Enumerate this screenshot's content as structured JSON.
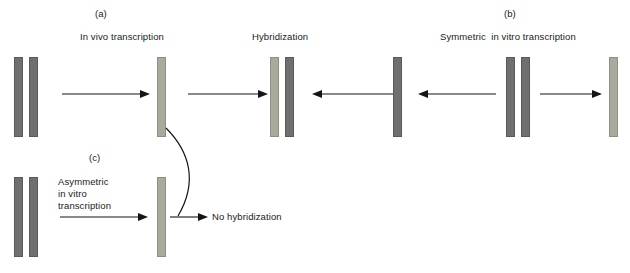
{
  "figure": {
    "colors": {
      "double_strand_dark": "#6f6f6f",
      "single_strand_light": "#a9a99c",
      "stroke": "#151515",
      "background": "#ffffff"
    }
  },
  "panels": {
    "a": {
      "tag": "(a)",
      "process_label": "In vivo transcription",
      "result_label": "Hybridization"
    },
    "b": {
      "tag": "(b)",
      "process_label": "Symmetric  in vitro transcription"
    },
    "c": {
      "tag": "(c)",
      "process_label_line1": "Asymmetric",
      "process_label_line2": "in vitro",
      "process_label_line3": "transcription",
      "result_label": "No hybridization"
    }
  },
  "elements": {
    "a_dsdna_left": "double-stranded-dna",
    "a_ssrna": "single-strand-light",
    "a_hybrid_light": "hybrid-light-strand",
    "a_hybrid_dark": "hybrid-dark-strand",
    "b_ssrna_left": "single-strand-dark",
    "b_dsdna": "double-stranded-dna",
    "b_ssrna_right": "single-strand-light",
    "c_dsdna": "double-stranded-dna",
    "c_ssrna": "single-strand-light"
  }
}
